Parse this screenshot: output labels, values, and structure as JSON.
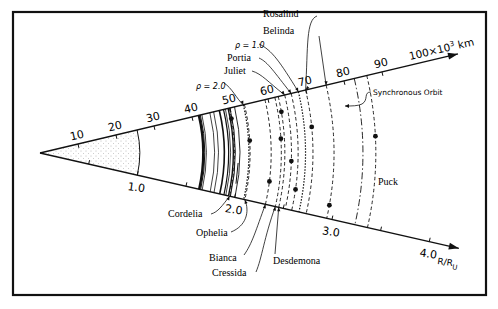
{
  "figure": {
    "upper_axis_label": "100×10³ km",
    "upper_axis_unit_base": "100×10",
    "upper_axis_unit_exp": "3",
    "upper_axis_unit_suffix": " km",
    "lower_axis_label": "R/R",
    "lower_axis_label_sub": "U",
    "synchronous_orbit_label": "Synchronous Orbit",
    "rho_labels": [
      {
        "id": "rho-2",
        "text": "ρ = 2.0"
      },
      {
        "id": "rho-1",
        "text": "ρ = 1.0"
      }
    ]
  },
  "chart_data": {
    "type": "diagram",
    "title": "",
    "upper_axis": {
      "label": "100×10³ km",
      "ticks": [
        10,
        20,
        30,
        40,
        50,
        60,
        70,
        80,
        90
      ],
      "tick_labels": [
        "10",
        "20",
        "30",
        "40",
        "50",
        "60",
        "70",
        "80",
        "90"
      ],
      "range": [
        0,
        110
      ]
    },
    "lower_axis": {
      "label": "R/R_U",
      "ticks": [
        0.5,
        1.0,
        1.5,
        2.0,
        2.5,
        3.0,
        3.5,
        4.0
      ],
      "tick_labels": [
        "",
        "1.0",
        "",
        "2.0",
        "",
        "3.0",
        "",
        "4.0"
      ],
      "range": [
        0,
        4.3
      ],
      "planet_radius_km_thousands": 25.56
    },
    "planet_region_radius": 25.56,
    "rings_solid": [
      41.8,
      42.2,
      42.6,
      44.7,
      45.7,
      47.2,
      48.3,
      48.8,
      49.5,
      50.0,
      51.2
    ],
    "roche_limits": [
      {
        "label": "ρ = 2.0",
        "radius": 53.5
      },
      {
        "label": "ρ = 1.0",
        "radius": 68.0
      }
    ],
    "synchronous_orbit_radius": 82.7,
    "moons": [
      {
        "name": "Cordelia",
        "radius": 49.8,
        "angle_frac": 0.12
      },
      {
        "name": "Ophelia",
        "radius": 53.8,
        "angle_frac": 0.38
      },
      {
        "name": "Bianca",
        "radius": 59.2,
        "angle_frac": 0.78
      },
      {
        "name": "Cressida",
        "radius": 61.8,
        "angle_frac": 0.38
      },
      {
        "name": "Desdemona",
        "radius": 62.7,
        "angle_frac": 0.14
      },
      {
        "name": "Juliet",
        "radius": 64.4,
        "angle_frac": 0.58
      },
      {
        "name": "Portia",
        "radius": 66.1,
        "angle_frac": 0.82
      },
      {
        "name": "Rosalind",
        "radius": 69.9,
        "angle_frac": 0.3
      },
      {
        "name": "Belinda",
        "radius": 75.3,
        "angle_frac": 0.9
      },
      {
        "name": "Puck",
        "radius": 86.0,
        "angle_frac": 0.4
      }
    ],
    "labels": {
      "top": [
        "Rosalind",
        "Belinda",
        "Portia",
        "Juliet"
      ],
      "bottom": [
        "Cordelia",
        "Ophelia",
        "Bianca",
        "Cressida",
        "Desdemona"
      ],
      "right": [
        "Puck"
      ]
    }
  }
}
